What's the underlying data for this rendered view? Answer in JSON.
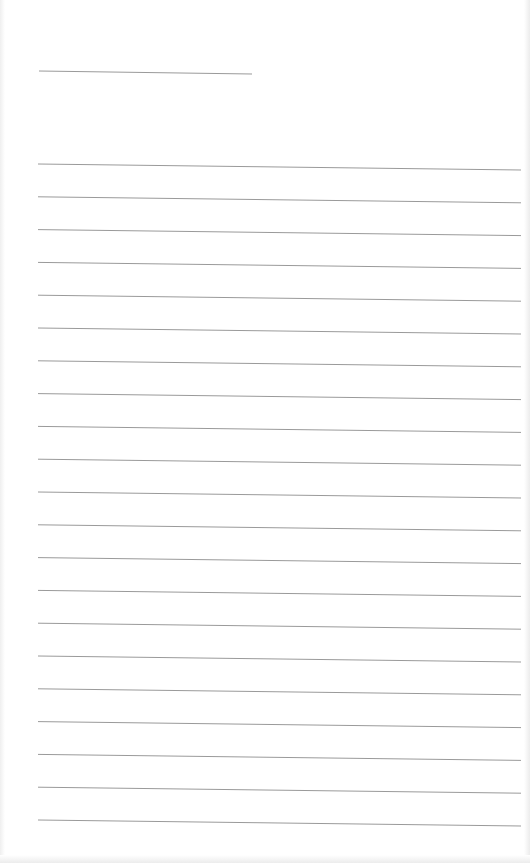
{
  "document": {
    "type": "lined-paper",
    "line_color": "#9a9a9a",
    "background": "#ffffff",
    "header_line": {
      "x1": 39,
      "y1": 71,
      "x2": 252,
      "y2": 74
    },
    "ruled_lines": {
      "count": 21,
      "x_start": 38,
      "x_end": 521,
      "first_y": 164,
      "spacing": 32.8,
      "slope_drop": 6
    }
  }
}
